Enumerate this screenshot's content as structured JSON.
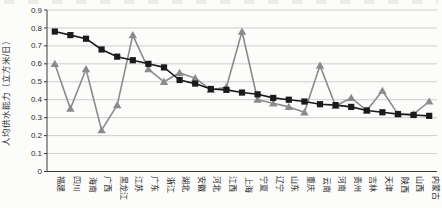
{
  "chart_data": {
    "type": "line",
    "categories": [
      "福建",
      "四川",
      "海南",
      "广西",
      "黑龙江",
      "江苏",
      "广东",
      "浙江",
      "湖北",
      "安徽",
      "河北",
      "江西",
      "上海",
      "宁夏",
      "辽宁",
      "山东",
      "重庆",
      "云南",
      "河南",
      "贵州",
      "吉林",
      "天津",
      "陕西",
      "山西",
      "内蒙古"
    ],
    "series": [
      {
        "marker": "square",
        "color": "#1b1b1b",
        "values": [
          0.78,
          0.76,
          0.74,
          0.68,
          0.64,
          0.62,
          0.6,
          0.58,
          0.51,
          0.49,
          0.46,
          0.455,
          0.44,
          0.43,
          0.41,
          0.4,
          0.39,
          0.375,
          0.37,
          0.36,
          0.34,
          0.33,
          0.32,
          0.315,
          0.31
        ]
      },
      {
        "marker": "triangle",
        "color": "#8b8b8b",
        "values": [
          0.6,
          0.35,
          0.57,
          0.23,
          0.37,
          0.76,
          0.57,
          0.5,
          0.55,
          0.52,
          0.455,
          0.47,
          0.78,
          0.4,
          0.38,
          0.36,
          0.33,
          0.59,
          0.365,
          0.41,
          0.34,
          0.45,
          0.32,
          0.32,
          0.39
        ]
      }
    ],
    "ylabel": "人均供水能力（立方米/日）",
    "ylim": [
      0,
      0.9
    ],
    "ytick_step": 0.1,
    "y_tick_labels": [
      "0.9",
      "0.8",
      "0.7",
      "0.6",
      "0.5",
      "0.4",
      "0.3",
      "0.2",
      "0.1",
      "0"
    ],
    "grid": true,
    "legend": "none",
    "colors": {
      "grid_line": "#cdcdcd",
      "axis_line": "#3a3a3a",
      "tick_text": "#2b2b2b"
    }
  }
}
